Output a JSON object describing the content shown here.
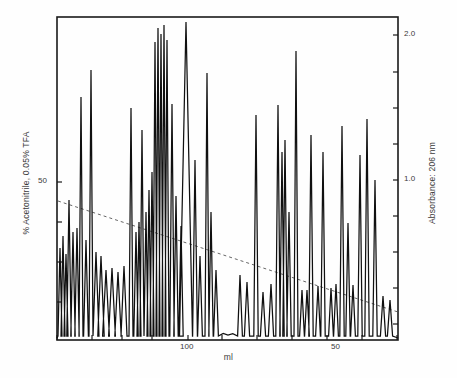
{
  "chart_data": {
    "type": "line",
    "title": "",
    "subtitle": "",
    "xlabel": "ml",
    "ylabel_left": "% Acetonitrile, 0.05% TFA",
    "ylabel_right": "Absorbance: 206 nm",
    "x_axis": {
      "label": "ml",
      "direction": "decreasing",
      "tick_labels": [
        "100",
        "50"
      ],
      "labeled_ticks": [
        {
          "value": "100",
          "px": 188
        },
        {
          "value": "50",
          "px": 338
        }
      ],
      "tick_px": [
        57,
        92,
        122,
        152,
        188,
        222,
        257,
        292,
        327,
        362,
        397
      ],
      "grid": false,
      "range_px": [
        57,
        398
      ]
    },
    "y_axis_left": {
      "label": "% Acetonitrile, 0.05% TFA",
      "tick_labels": [
        "50"
      ],
      "labeled_ticks": [
        {
          "value": "50",
          "px": 182
        }
      ],
      "tick_px": [
        182,
        222,
        262,
        302
      ],
      "grid": false
    },
    "y_axis_right": {
      "label": "Absorbance: 206 nm",
      "tick_labels": [
        "2.0",
        "1.0"
      ],
      "labeled_ticks": [
        {
          "value": "2.0",
          "px": 35
        },
        {
          "value": "1.0",
          "px": 180
        }
      ],
      "tick_px": [
        35,
        72,
        108,
        144,
        180,
        216,
        252,
        288,
        324
      ],
      "grid": false,
      "ylim": [
        0.0,
        2.2
      ]
    },
    "plot_frame": {
      "left": 57,
      "top": 17,
      "right": 398,
      "bottom": 340
    },
    "legend": {
      "entries": [],
      "position": "none"
    },
    "annotations": [],
    "series": [
      {
        "name": "Gradient (% Acetonitrile)",
        "style": "dashed",
        "color": "#555555",
        "points_px": [
          [
            58,
            201
          ],
          [
            398,
            312
          ]
        ]
      },
      {
        "name": "Absorbance trace 206 nm",
        "style": "solid",
        "color": "#101010",
        "baseline_px": 337,
        "peaks_px": [
          {
            "x": 60,
            "top": 248,
            "w": 2.0
          },
          {
            "x": 63,
            "top": 236,
            "w": 2.0
          },
          {
            "x": 66,
            "top": 254,
            "w": 2.0
          },
          {
            "x": 69,
            "top": 200,
            "w": 2.2
          },
          {
            "x": 73,
            "top": 232,
            "w": 2.2
          },
          {
            "x": 77,
            "top": 228,
            "w": 2.2
          },
          {
            "x": 81,
            "top": 97,
            "w": 2.0
          },
          {
            "x": 86,
            "top": 240,
            "w": 2.4
          },
          {
            "x": 91,
            "top": 70,
            "w": 2.0
          },
          {
            "x": 96,
            "top": 252,
            "w": 3.0
          },
          {
            "x": 101,
            "top": 256,
            "w": 3.2
          },
          {
            "x": 106,
            "top": 270,
            "w": 3.4
          },
          {
            "x": 112,
            "top": 268,
            "w": 3.4
          },
          {
            "x": 118,
            "top": 272,
            "w": 3.2
          },
          {
            "x": 124,
            "top": 266,
            "w": 3.0
          },
          {
            "x": 131,
            "top": 108,
            "w": 2.0
          },
          {
            "x": 136,
            "top": 232,
            "w": 2.2
          },
          {
            "x": 139,
            "top": 222,
            "w": 2.0
          },
          {
            "x": 142,
            "top": 130,
            "w": 2.0
          },
          {
            "x": 146,
            "top": 212,
            "w": 2.0
          },
          {
            "x": 149,
            "top": 190,
            "w": 2.0
          },
          {
            "x": 152,
            "top": 172,
            "w": 2.0
          },
          {
            "x": 155,
            "top": 42,
            "w": 2.0
          },
          {
            "x": 158,
            "top": 28,
            "w": 2.0
          },
          {
            "x": 161,
            "top": 34,
            "w": 2.0
          },
          {
            "x": 164,
            "top": 25,
            "w": 2.0
          },
          {
            "x": 167,
            "top": 40,
            "w": 2.0
          },
          {
            "x": 172,
            "top": 104,
            "w": 2.2
          },
          {
            "x": 176,
            "top": 196,
            "w": 2.2
          },
          {
            "x": 181,
            "top": 226,
            "w": 2.2
          },
          {
            "x": 186,
            "top": 22,
            "w": 6.5
          },
          {
            "x": 195,
            "top": 160,
            "w": 2.4
          },
          {
            "x": 200,
            "top": 256,
            "w": 2.4
          },
          {
            "x": 207,
            "top": 73,
            "w": 2.0
          },
          {
            "x": 211,
            "top": 212,
            "w": 2.2
          },
          {
            "x": 216,
            "top": 270,
            "w": 2.4
          },
          {
            "x": 240,
            "top": 275,
            "w": 2.4
          },
          {
            "x": 247,
            "top": 282,
            "w": 2.6
          },
          {
            "x": 256,
            "top": 115,
            "w": 2.2
          },
          {
            "x": 263,
            "top": 292,
            "w": 2.6
          },
          {
            "x": 271,
            "top": 284,
            "w": 2.6
          },
          {
            "x": 278,
            "top": 105,
            "w": 2.2
          },
          {
            "x": 282,
            "top": 152,
            "w": 2.2
          },
          {
            "x": 285,
            "top": 140,
            "w": 2.2
          },
          {
            "x": 289,
            "top": 212,
            "w": 2.2
          },
          {
            "x": 296,
            "top": 51,
            "w": 2.0
          },
          {
            "x": 302,
            "top": 290,
            "w": 2.4
          },
          {
            "x": 307,
            "top": 290,
            "w": 2.4
          },
          {
            "x": 311,
            "top": 135,
            "w": 2.2
          },
          {
            "x": 318,
            "top": 286,
            "w": 2.4
          },
          {
            "x": 323,
            "top": 152,
            "w": 2.2
          },
          {
            "x": 331,
            "top": 288,
            "w": 2.4
          },
          {
            "x": 336,
            "top": 284,
            "w": 2.4
          },
          {
            "x": 342,
            "top": 126,
            "w": 2.2
          },
          {
            "x": 348,
            "top": 223,
            "w": 2.2
          },
          {
            "x": 353,
            "top": 285,
            "w": 2.4
          },
          {
            "x": 360,
            "top": 155,
            "w": 2.2
          },
          {
            "x": 367,
            "top": 119,
            "w": 2.2
          },
          {
            "x": 375,
            "top": 180,
            "w": 2.2
          },
          {
            "x": 383,
            "top": 296,
            "w": 2.6
          },
          {
            "x": 390,
            "top": 300,
            "w": 2.6
          }
        ]
      }
    ]
  }
}
